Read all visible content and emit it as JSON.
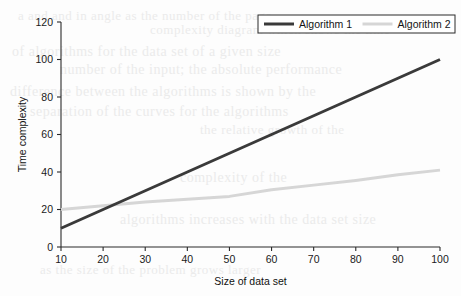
{
  "chart_data": {
    "type": "line",
    "title": "",
    "xlabel": "Size of data set",
    "ylabel": "Time complexity",
    "xlim": [
      10,
      100
    ],
    "ylim": [
      0,
      120
    ],
    "xticks": [
      10,
      20,
      30,
      40,
      50,
      60,
      70,
      80,
      90,
      100
    ],
    "yticks": [
      0,
      20,
      40,
      60,
      80,
      100,
      120
    ],
    "grid": false,
    "legend_position": "top-right",
    "x": [
      10,
      20,
      30,
      40,
      50,
      60,
      70,
      80,
      90,
      100
    ],
    "series": [
      {
        "name": "Algorithm 1",
        "color": "#3a3a3a",
        "width": 3.0,
        "values": [
          10,
          20,
          30,
          40,
          50,
          60,
          70,
          80,
          90,
          100
        ]
      },
      {
        "name": "Algorithm 2",
        "color": "#d6d6d6",
        "width": 3.0,
        "values": [
          20,
          22,
          24,
          25.5,
          27,
          30.5,
          33,
          35.5,
          38.5,
          41
        ]
      }
    ]
  },
  "axes": {
    "y_tick_labels": [
      "0",
      "20",
      "40",
      "60",
      "80",
      "100",
      "120"
    ],
    "x_tick_labels": [
      "10",
      "20",
      "30",
      "40",
      "50",
      "60",
      "70",
      "80",
      "90",
      "100"
    ],
    "x_axis_title": "Size of data set",
    "y_axis_title": "Time complexity"
  },
  "legend": {
    "entries": [
      {
        "label": "Algorithm 1",
        "color": "#3a3a3a"
      },
      {
        "label": "Algorithm 2",
        "color": "#d6d6d6"
      }
    ]
  },
  "bleed_text": [
    {
      "t": "a and and in angle as the number of the page",
      "x": 18,
      "y": 8,
      "s": 13
    },
    {
      "t": "complexity diagram which shows the time",
      "x": 150,
      "y": 22,
      "s": 13
    },
    {
      "t": "of algorithms for the data set of a given size",
      "x": 12,
      "y": 44,
      "s": 14
    },
    {
      "t": "number of the input; the absolute performance",
      "x": 60,
      "y": 62,
      "s": 14
    },
    {
      "t": "difference between the algorithms is shown by the",
      "x": 10,
      "y": 84,
      "s": 14
    },
    {
      "t": "separation of the curves for the algorithms",
      "x": 30,
      "y": 104,
      "s": 14
    },
    {
      "t": "the relative growth of the",
      "x": 200,
      "y": 122,
      "s": 13
    },
    {
      "t": "complexity of the",
      "x": 180,
      "y": 170,
      "s": 14
    },
    {
      "t": "algorithms increases with the data set size",
      "x": 120,
      "y": 212,
      "s": 14
    },
    {
      "t": "as the size of the problem grows larger",
      "x": 40,
      "y": 262,
      "s": 13
    }
  ]
}
